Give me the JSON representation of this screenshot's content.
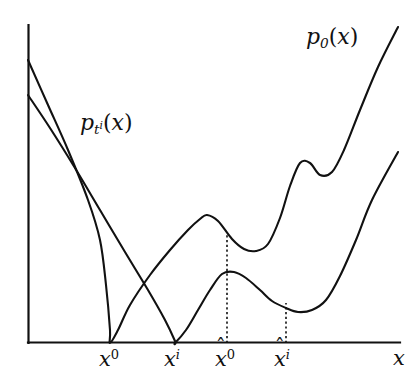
{
  "figure": {
    "kind": "line-plot",
    "background_color": "#ffffff",
    "stroke_color": "#111111",
    "axes": {
      "x_axis_label": "x",
      "y_axis_label": "",
      "origin_px": [
        28,
        343
      ],
      "x_axis_end_px": [
        400,
        343
      ],
      "y_axis_top_px": [
        28,
        25
      ],
      "grid": false
    },
    "curve_labels": {
      "upper": {
        "base": "p",
        "sub": "0",
        "arg": "(x)",
        "text": "p0(x)"
      },
      "lower": {
        "base": "p",
        "sub": "t",
        "sub_sup": "i",
        "arg": "(x)",
        "text": "pti(x)"
      }
    },
    "x_tick_labels": [
      {
        "id": "x0",
        "base": "x",
        "sup": "0",
        "hat": false,
        "text": "x0"
      },
      {
        "id": "xi",
        "base": "x",
        "sup": "i",
        "hat": false,
        "text": "xi"
      },
      {
        "id": "xhat0",
        "base": "x",
        "sup": "0",
        "hat": true,
        "text": "x̂0"
      },
      {
        "id": "xhati",
        "base": "x",
        "sup": "i",
        "hat": true,
        "text": "x̂i"
      },
      {
        "id": "xaxis",
        "base": "x",
        "sup": "",
        "hat": false,
        "text": "x"
      }
    ],
    "guides": [
      {
        "id": "guide-xhat0",
        "from": [
          227,
          343
        ],
        "to": [
          227,
          235
        ]
      },
      {
        "id": "guide-xhati",
        "from": [
          286,
          343
        ],
        "to": [
          286,
          303
        ]
      }
    ]
  },
  "chart_data": {
    "type": "line",
    "title": "",
    "xlabel": "x",
    "ylabel": "",
    "grid": false,
    "legend": "inline-annotations",
    "annotations": [
      {
        "text": "p0(x)",
        "x_px": 330,
        "y_px": 40
      },
      {
        "text": "pti(x)",
        "x_px": 120,
        "y_px": 127
      }
    ],
    "x_markers": [
      {
        "label": "x0",
        "x_px": 110,
        "note": "zero/touch point of p0(x)"
      },
      {
        "label": "xi",
        "x_px": 175,
        "note": "zero/touch point of pti(x)"
      },
      {
        "label": "xhat0",
        "x_px": 227,
        "note": "dotted guide to p0(x)"
      },
      {
        "label": "xhati",
        "x_px": 286,
        "note": "dotted guide to pti(x)"
      }
    ],
    "series": [
      {
        "name": "p0(x)",
        "points_px": [
          [
            28,
            60
          ],
          [
            48,
            105
          ],
          [
            68,
            150
          ],
          [
            88,
            200
          ],
          [
            100,
            240
          ],
          [
            106,
            285
          ],
          [
            110,
            330
          ],
          [
            110,
            343
          ],
          [
            118,
            330
          ],
          [
            130,
            305
          ],
          [
            150,
            275
          ],
          [
            170,
            250
          ],
          [
            188,
            230
          ],
          [
            200,
            219
          ],
          [
            207,
            215
          ],
          [
            218,
            221
          ],
          [
            232,
            239
          ],
          [
            244,
            249
          ],
          [
            256,
            251
          ],
          [
            268,
            244
          ],
          [
            280,
            218
          ],
          [
            290,
            186
          ],
          [
            300,
            163
          ],
          [
            310,
            163
          ],
          [
            320,
            175
          ],
          [
            332,
            172
          ],
          [
            344,
            150
          ],
          [
            360,
            110
          ],
          [
            378,
            67
          ],
          [
            398,
            27
          ]
        ]
      },
      {
        "name": "pti(x)",
        "points_px": [
          [
            28,
            95
          ],
          [
            50,
            128
          ],
          [
            75,
            168
          ],
          [
            100,
            210
          ],
          [
            125,
            252
          ],
          [
            148,
            290
          ],
          [
            165,
            320
          ],
          [
            175,
            341
          ],
          [
            175,
            343
          ],
          [
            186,
            330
          ],
          [
            198,
            310
          ],
          [
            210,
            290
          ],
          [
            222,
            274
          ],
          [
            234,
            272
          ],
          [
            246,
            278
          ],
          [
            260,
            290
          ],
          [
            272,
            301
          ],
          [
            286,
            308
          ],
          [
            298,
            312
          ],
          [
            312,
            310
          ],
          [
            326,
            300
          ],
          [
            340,
            276
          ],
          [
            356,
            240
          ],
          [
            372,
            200
          ],
          [
            398,
            152
          ]
        ]
      }
    ]
  }
}
